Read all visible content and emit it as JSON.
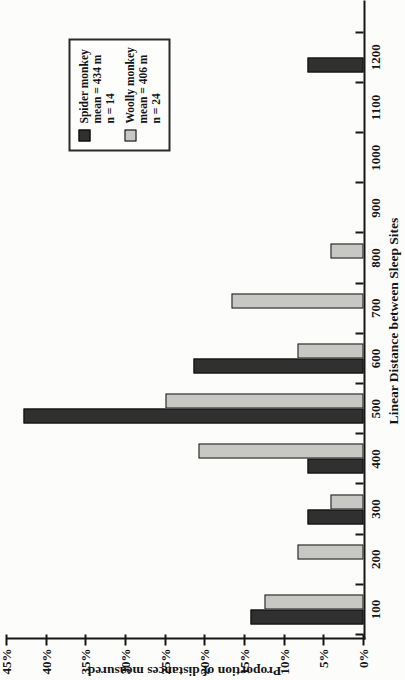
{
  "figure": {
    "background": "#fcfcfb",
    "axis_color": "#161616"
  },
  "chart_data": {
    "type": "bar",
    "title": "",
    "xlabel": "Linear Distance between Sleep Sites",
    "ylabel": "Proportion of distances measured",
    "categories": [
      "100",
      "200",
      "300",
      "400",
      "500",
      "600",
      "700",
      "800",
      "900",
      "1000",
      "1100",
      "1200"
    ],
    "y_tick_labels": [
      "0%",
      "5%",
      "10%",
      "15%",
      "20%",
      "25%",
      "30%",
      "35%",
      "40%",
      "45%"
    ],
    "ylim": [
      0,
      45
    ],
    "layout": {
      "rendered_rotation_deg_ccw": 90,
      "grid": false,
      "legend_position": "top-right-of-plot",
      "bar_gap": "paired bars, spider left / woolly right"
    },
    "series": [
      {
        "name": "Spider monkey",
        "legend_lines": [
          "Spider monkey",
          "mean = 434 m",
          "n = 14"
        ],
        "mean_m": 434,
        "n": 14,
        "color": "#303030",
        "border": "#0a0a0a",
        "values_pct": [
          14.3,
          0,
          7.1,
          7.1,
          42.9,
          21.4,
          0,
          0,
          0,
          0,
          0,
          7.1
        ]
      },
      {
        "name": "Woolly monkey",
        "legend_lines": [
          "Woolly monkey",
          "mean = 406 m",
          "n = 24"
        ],
        "mean_m": 406,
        "n": 24,
        "color": "#c7c7c4",
        "border": "#161616",
        "values_pct": [
          12.5,
          8.3,
          4.2,
          20.8,
          25.0,
          8.3,
          16.7,
          4.2,
          0,
          0,
          0,
          0
        ]
      }
    ]
  }
}
